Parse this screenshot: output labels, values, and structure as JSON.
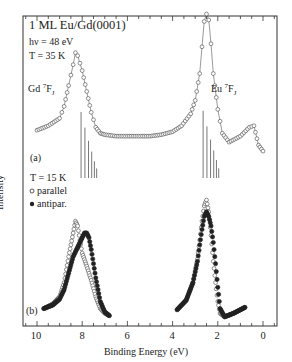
{
  "chart_data": {
    "type": "scatter",
    "title": "1 ML Eu/Gd(0001)",
    "xlabel": "Binding Energy (eV)",
    "ylabel": "Intensity",
    "x_reversed": true,
    "xlim": [
      10.5,
      -0.6
    ],
    "xticks": [
      10,
      8,
      6,
      4,
      2,
      0
    ],
    "grid": false,
    "panels": [
      {
        "label": "(a)",
        "conditions": [
          "hν = 48 eV",
          "T = 35 K"
        ],
        "annotations": [
          {
            "text": "Gd 7FJ",
            "x": 8.3
          },
          {
            "text": "Eu 7FJ",
            "x": 2.6
          }
        ],
        "series": [
          {
            "name": "spectrum",
            "marker": "open-circle-line",
            "x": [
              10.0,
              9.5,
              9.0,
              8.8,
              8.6,
              8.4,
              8.3,
              8.2,
              8.0,
              7.8,
              7.6,
              7.4,
              7.2,
              7.0,
              6.5,
              6.0,
              5.5,
              5.0,
              4.5,
              4.0,
              3.6,
              3.2,
              3.0,
              2.8,
              2.7,
              2.6,
              2.5,
              2.4,
              2.3,
              2.2,
              2.0,
              1.8,
              1.5,
              1.0,
              0.6,
              0.4,
              0.2,
              0.0
            ],
            "y": [
              0.22,
              0.25,
              0.3,
              0.38,
              0.52,
              0.66,
              0.74,
              0.72,
              0.62,
              0.48,
              0.34,
              0.24,
              0.2,
              0.19,
              0.18,
              0.18,
              0.18,
              0.18,
              0.19,
              0.21,
              0.25,
              0.33,
              0.42,
              0.6,
              0.78,
              0.95,
              1.0,
              0.96,
              0.8,
              0.6,
              0.36,
              0.2,
              0.14,
              0.18,
              0.24,
              0.25,
              0.12,
              0.08
            ]
          },
          {
            "name": "Gd 7FJ multiplet",
            "marker": "stick",
            "x": [
              8.05,
              7.88,
              7.72,
              7.58,
              7.46,
              7.36
            ],
            "y": [
              0.55,
              0.42,
              0.31,
              0.22,
              0.14,
              0.08
            ]
          },
          {
            "name": "Eu 7FJ multiplet",
            "marker": "stick",
            "x": [
              2.65,
              2.48,
              2.32,
              2.18,
              2.06,
              1.96
            ],
            "y": [
              0.56,
              0.43,
              0.32,
              0.23,
              0.15,
              0.08
            ]
          }
        ]
      },
      {
        "label": "(b)",
        "conditions": [
          "T = 15 K"
        ],
        "legend": [
          {
            "marker": "open-circle",
            "text": "parallel"
          },
          {
            "marker": "filled-circle",
            "text": "antipar."
          }
        ],
        "series": [
          {
            "name": "parallel",
            "marker": "open-circle",
            "x": [
              9.7,
              9.3,
              9.0,
              8.8,
              8.6,
              8.4,
              8.3,
              8.2,
              8.1,
              8.0,
              7.8,
              7.6,
              7.4,
              7.2,
              7.0,
              6.8,
              3.8,
              3.4,
              3.1,
              2.9,
              2.8,
              2.7,
              2.6,
              2.5,
              2.4,
              2.3,
              2.2,
              2.1,
              2.0,
              1.9,
              1.7,
              1.3,
              0.8
            ],
            "y": [
              0.08,
              0.12,
              0.18,
              0.3,
              0.52,
              0.72,
              0.82,
              0.78,
              0.66,
              0.55,
              0.44,
              0.32,
              0.18,
              0.08,
              0.04,
              0.02,
              0.07,
              0.15,
              0.3,
              0.5,
              0.66,
              0.82,
              0.95,
              1.0,
              0.9,
              0.7,
              0.48,
              0.3,
              0.14,
              0.04,
              0.01,
              0.04,
              0.09
            ]
          },
          {
            "name": "antipar.",
            "marker": "filled-circle",
            "x": [
              9.7,
              9.3,
              9.0,
              8.8,
              8.6,
              8.4,
              8.2,
              8.0,
              7.9,
              7.8,
              7.7,
              7.6,
              7.4,
              7.2,
              7.0,
              6.8,
              3.8,
              3.4,
              3.1,
              2.9,
              2.8,
              2.7,
              2.6,
              2.5,
              2.4,
              2.3,
              2.2,
              2.1,
              2.0,
              1.9,
              1.7,
              1.3,
              0.8
            ],
            "y": [
              0.08,
              0.11,
              0.16,
              0.24,
              0.38,
              0.52,
              0.6,
              0.68,
              0.72,
              0.72,
              0.68,
              0.58,
              0.34,
              0.14,
              0.05,
              0.02,
              0.07,
              0.15,
              0.3,
              0.48,
              0.62,
              0.75,
              0.86,
              0.9,
              0.86,
              0.78,
              0.64,
              0.46,
              0.26,
              0.08,
              0.01,
              0.04,
              0.09
            ]
          }
        ]
      }
    ]
  },
  "labels": {
    "title": "1 ML Eu/Gd(0001)",
    "photon_energy": "hν = 48 eV",
    "temp_a": "T = 35 K",
    "gd_label": "Gd ",
    "gd_sup": "7",
    "gd_sub": "F",
    "gd_j": "J",
    "eu_label": "Eu ",
    "eu_sup": "7",
    "eu_sub": "F",
    "eu_j": "J",
    "panel_a": "(a)",
    "temp_b": "T = 15 K",
    "legend_parallel": "parallel",
    "legend_antipar": "antipar.",
    "panel_b": "(b)",
    "ylabel": "Intensity",
    "xlabel": "Binding Energy (eV)",
    "ticks": [
      "10",
      "8",
      "6",
      "4",
      "2",
      "0"
    ]
  }
}
